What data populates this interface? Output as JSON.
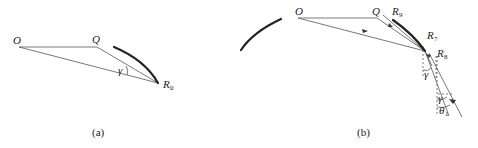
{
  "figure": {
    "panel_a": {
      "caption": "(a)",
      "labels": {
        "O": "O",
        "Q": "Q",
        "R": "R",
        "R_sub": "0",
        "gamma": "γ"
      }
    },
    "panel_b": {
      "caption": "(b)",
      "labels": {
        "O": "O",
        "Q": "Q",
        "R9": "R",
        "R9_sub": "9",
        "R7": "R",
        "R7_sub": "7",
        "R8": "R",
        "R8_sub": "8",
        "gamma_1": "γ",
        "gamma_2": "γ",
        "theta": "θ",
        "theta_sub": "1"
      }
    }
  }
}
